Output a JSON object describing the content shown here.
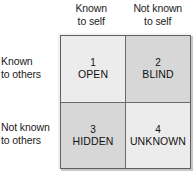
{
  "diagram": {
    "columns": [
      {
        "line1": "Known",
        "line2": "to self"
      },
      {
        "line1": "Not known",
        "line2": "to self"
      }
    ],
    "rows": [
      {
        "line1": "Known",
        "line2": "to others"
      },
      {
        "line1": "Not known",
        "line2": "to others"
      }
    ],
    "quadrants": [
      {
        "number": "1",
        "name": "OPEN",
        "shade": "light"
      },
      {
        "number": "2",
        "name": "BLIND",
        "shade": "dark"
      },
      {
        "number": "3",
        "name": "HIDDEN",
        "shade": "dark"
      },
      {
        "number": "4",
        "name": "UNKNOWN",
        "shade": "light"
      }
    ],
    "colors": {
      "background": "#ffffff",
      "cell_light": "#ececec",
      "cell_dark": "#d7d7d7",
      "grid_line": "#5f5f5f",
      "text": "#111111"
    }
  }
}
